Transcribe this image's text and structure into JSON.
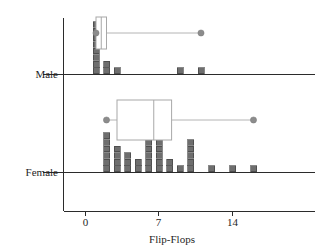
{
  "chart_data": {
    "type": "dotplot-boxplot",
    "title": "",
    "xlabel": "Flip-Flops",
    "ylabel": "",
    "xlim": [
      -1.2,
      18.5
    ],
    "xticks": [
      0,
      7,
      14
    ],
    "xtick_labels": [
      "0",
      "7",
      "14"
    ],
    "grid": false,
    "legend": "none",
    "groups": [
      {
        "name": "Male",
        "label": "Male",
        "dotplot": {
          "x": [
            1,
            2,
            3,
            9,
            11
          ],
          "counts": [
            8,
            2,
            1,
            1,
            1
          ]
        },
        "boxplot": {
          "min": 1,
          "q1": 1,
          "median": 1.5,
          "q3": 2,
          "max": 11
        }
      },
      {
        "name": "Female",
        "label": "Female",
        "dotplot": {
          "x": [
            2,
            3,
            4,
            5,
            6,
            7,
            8,
            9,
            10,
            12,
            14,
            16
          ],
          "counts": [
            6,
            4,
            3,
            2,
            5,
            5,
            2,
            1,
            5,
            1,
            1,
            1
          ]
        },
        "boxplot": {
          "min": 2,
          "q1": 3,
          "median": 6.5,
          "q3": 8.2,
          "max": 16
        }
      }
    ],
    "colors": {
      "dot_fill": "#6e6e6e",
      "dot_stroke": "#3a3a3a",
      "box_stroke": "#a8a8a8",
      "whisker_dot": "#8c8c8c",
      "axis": "#2b2b2b"
    }
  }
}
